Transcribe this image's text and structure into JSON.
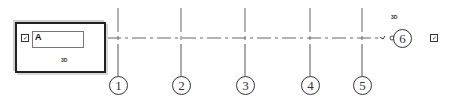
{
  "view": {
    "frame_label": "A",
    "frame_tag": "3D",
    "right_tag": "3D"
  },
  "grids": [
    {
      "label": "1",
      "x": 118
    },
    {
      "label": "2",
      "x": 181
    },
    {
      "label": "3",
      "x": 245
    },
    {
      "label": "4",
      "x": 310
    },
    {
      "label": "5",
      "x": 362
    }
  ],
  "elevation_marker": {
    "label": "6"
  },
  "colors": {
    "line": "#555555",
    "frame": "#222222",
    "background": "#ffffff"
  }
}
